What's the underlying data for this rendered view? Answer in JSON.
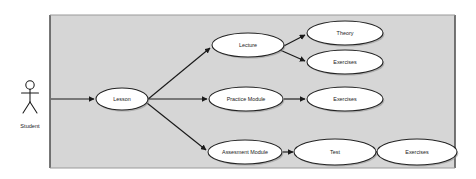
{
  "diagram": {
    "type": "uml-use-case-diagram",
    "background_color": "#ffffff",
    "boundary_fill": "#d6d6d6",
    "boundary_stroke": "#555555",
    "node_fill": "#ffffff",
    "node_stroke": "#222222",
    "connector_color": "#1a1a1a",
    "actor": {
      "name": "actor-student",
      "label": "Student",
      "x": 30,
      "y": 103,
      "label_x": 30,
      "label_y": 127
    },
    "boundary": {
      "name": "system-boundary",
      "x": 50,
      "y": 15,
      "width": 405,
      "height": 153
    },
    "watermark": {
      "label": "",
      "x": 167,
      "y": 152
    },
    "use_cases": [
      {
        "id": "lesson",
        "label": "Lesson",
        "cx": 122,
        "cy": 99,
        "rx": 26,
        "ry": 11
      },
      {
        "id": "lecture",
        "label": "Lecture",
        "cx": 248,
        "cy": 45,
        "rx": 36,
        "ry": 12
      },
      {
        "id": "theory",
        "label": "Theory",
        "cx": 345,
        "cy": 33,
        "rx": 38,
        "ry": 12
      },
      {
        "id": "exercises-lecture",
        "label": "Exercises",
        "cx": 345,
        "cy": 62,
        "rx": 38,
        "ry": 12
      },
      {
        "id": "practice-module",
        "label": "Practice Module",
        "cx": 246,
        "cy": 99,
        "rx": 37,
        "ry": 12
      },
      {
        "id": "exercises-practice",
        "label": "Exercises",
        "cx": 345,
        "cy": 99,
        "rx": 38,
        "ry": 12
      },
      {
        "id": "assesment-module",
        "label": "Assesment Module",
        "cx": 245,
        "cy": 152,
        "rx": 37,
        "ry": 12
      },
      {
        "id": "test",
        "label": "Test",
        "cx": 335,
        "cy": 152,
        "rx": 41,
        "ry": 13
      },
      {
        "id": "exercises-test",
        "label": "Exercises",
        "cx": 417,
        "cy": 152,
        "rx": 40,
        "ry": 13
      }
    ],
    "connectors": [
      {
        "id": "student-to-lesson",
        "from": "actor-student",
        "to": "lesson",
        "x1": 51,
        "y1": 99,
        "x2": 94,
        "y2": 99
      },
      {
        "id": "lesson-to-lecture",
        "from": "lesson",
        "to": "lecture",
        "x1": 147,
        "y1": 100,
        "x2": 210,
        "y2": 48
      },
      {
        "id": "lesson-to-practice-module",
        "from": "lesson",
        "to": "practice-module",
        "x1": 149,
        "y1": 99,
        "x2": 207,
        "y2": 99
      },
      {
        "id": "lesson-to-assesment-module",
        "from": "lesson",
        "to": "assesment-module",
        "x1": 147,
        "y1": 103,
        "x2": 206,
        "y2": 150
      },
      {
        "id": "lecture-to-theory",
        "from": "lecture",
        "to": "theory",
        "x1": 280,
        "y1": 48,
        "x2": 305,
        "y2": 35
      },
      {
        "id": "lecture-to-exercises",
        "from": "lecture",
        "to": "exercises-lecture",
        "x1": 280,
        "y1": 50,
        "x2": 305,
        "y2": 61
      },
      {
        "id": "practice-module-to-exercises",
        "from": "practice-module",
        "to": "exercises-practice",
        "x1": 284,
        "y1": 99,
        "x2": 305,
        "y2": 99
      },
      {
        "id": "assesment-module-to-test",
        "from": "assesment-module",
        "to": "test",
        "x1": 283,
        "y1": 152,
        "x2": 293,
        "y2": 152
      },
      {
        "id": "test-to-exercises",
        "from": "test",
        "to": "exercises-test",
        "x1": 377,
        "y1": 152,
        "x2": 376,
        "y2": 152
      }
    ]
  }
}
